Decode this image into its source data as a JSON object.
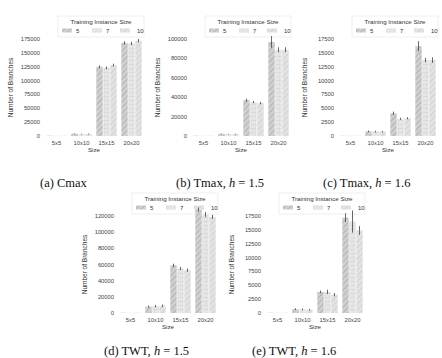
{
  "legend": {
    "title": "Training Instance Size",
    "entries": [
      "5",
      "7",
      "10"
    ]
  },
  "chart_data": [
    {
      "id": "a",
      "type": "bar",
      "caption": "(a) Cmax",
      "title": "",
      "xlabel": "Size",
      "ylabel": "Number of Branches",
      "categories": [
        "5x5",
        "10x10",
        "15x15",
        "20x20"
      ],
      "yticks": [
        0,
        25000,
        50000,
        75000,
        100000,
        125000,
        150000,
        175000
      ],
      "ylim": [
        0,
        180000
      ],
      "legend_title": "Training Instance Size",
      "legend_position": "top",
      "grid": false,
      "series": [
        {
          "name": "5",
          "values": [
            50,
            4000,
            125000,
            168000
          ],
          "errors": [
            0,
            800,
            2500,
            3000
          ]
        },
        {
          "name": "7",
          "values": [
            50,
            3500,
            123000,
            167000
          ],
          "errors": [
            0,
            700,
            2500,
            3000
          ]
        },
        {
          "name": "10",
          "values": [
            50,
            3800,
            128000,
            172000
          ],
          "errors": [
            0,
            700,
            2500,
            3000
          ]
        }
      ]
    },
    {
      "id": "b",
      "type": "bar",
      "caption": "(b) Tmax, h = 1.5",
      "title": "",
      "xlabel": "Size",
      "ylabel": "Number of Branches",
      "categories": [
        "5x5",
        "10x10",
        "15x15",
        "20x20"
      ],
      "yticks": [
        0,
        20000,
        40000,
        60000,
        80000,
        100000
      ],
      "ylim": [
        0,
        105000
      ],
      "legend_title": "Training Instance Size",
      "legend_position": "top",
      "grid": false,
      "series": [
        {
          "name": "5",
          "values": [
            30,
            2200,
            37000,
            97000
          ],
          "errors": [
            0,
            400,
            1500,
            6000
          ]
        },
        {
          "name": "7",
          "values": [
            30,
            1900,
            35000,
            89000
          ],
          "errors": [
            0,
            400,
            1200,
            2500
          ]
        },
        {
          "name": "10",
          "values": [
            30,
            2000,
            34000,
            89000
          ],
          "errors": [
            0,
            400,
            1200,
            2500
          ]
        }
      ]
    },
    {
      "id": "c",
      "type": "bar",
      "caption": "(c) Tmax, h = 1.6",
      "title": "",
      "xlabel": "Size",
      "ylabel": "Number of Branches",
      "categories": [
        "5x5",
        "10x10",
        "15x15",
        "20x20"
      ],
      "yticks": [
        0,
        2500,
        5000,
        7500,
        10000,
        12500,
        15000,
        17500
      ],
      "ylim": [
        0,
        18000
      ],
      "legend_title": "Training Instance Size",
      "legend_position": "top",
      "grid": false,
      "series": [
        {
          "name": "5",
          "values": [
            10,
            850,
            4100,
            16200
          ],
          "errors": [
            0,
            150,
            300,
            900
          ]
        },
        {
          "name": "7",
          "values": [
            10,
            800,
            3100,
            13700
          ],
          "errors": [
            0,
            150,
            200,
            400
          ]
        },
        {
          "name": "10",
          "values": [
            10,
            780,
            3200,
            13700
          ],
          "errors": [
            0,
            150,
            200,
            500
          ]
        }
      ]
    },
    {
      "id": "d",
      "type": "bar",
      "caption": "(d) TWT, h = 1.5",
      "title": "",
      "xlabel": "Size",
      "ylabel": "Number of Branches",
      "categories": [
        "5x5",
        "10x10",
        "15x15",
        "20x20"
      ],
      "yticks": [
        0,
        20000,
        40000,
        60000,
        80000,
        100000,
        120000
      ],
      "ylim": [
        0,
        130000
      ],
      "legend_title": "Training Instance Size",
      "legend_position": "top",
      "grid": false,
      "series": [
        {
          "name": "5",
          "values": [
            100,
            8000,
            59000,
            128000
          ],
          "errors": [
            0,
            1200,
            2000,
            2500
          ]
        },
        {
          "name": "7",
          "values": [
            100,
            8500,
            55000,
            122000
          ],
          "errors": [
            0,
            1500,
            2000,
            3000
          ]
        },
        {
          "name": "10",
          "values": [
            100,
            9000,
            53000,
            119000
          ],
          "errors": [
            0,
            1500,
            2000,
            2500
          ]
        }
      ]
    },
    {
      "id": "e",
      "type": "bar",
      "caption": "(e) TWT, h = 1.6",
      "title": "",
      "xlabel": "Size",
      "ylabel": "Number of Branches",
      "categories": [
        "5x5",
        "10x10",
        "15x15",
        "20x20"
      ],
      "yticks": [
        0,
        2500,
        5000,
        7500,
        10000,
        12500,
        15000,
        17500
      ],
      "ylim": [
        0,
        18500
      ],
      "legend_title": "Training Instance Size",
      "legend_position": "top",
      "grid": false,
      "series": [
        {
          "name": "5",
          "values": [
            15,
            700,
            3800,
            17200
          ],
          "errors": [
            0,
            150,
            250,
            800
          ]
        },
        {
          "name": "7",
          "values": [
            15,
            650,
            3800,
            16500
          ],
          "errors": [
            0,
            150,
            400,
            2000
          ]
        },
        {
          "name": "10",
          "values": [
            15,
            600,
            3300,
            14900
          ],
          "errors": [
            0,
            150,
            300,
            800
          ]
        }
      ]
    }
  ],
  "panels": [
    {
      "left": 0,
      "top": 8,
      "caption_left": 40,
      "caption_top": 176
    },
    {
      "left": 147,
      "top": 8,
      "caption_left": 176,
      "caption_top": 176
    },
    {
      "left": 294,
      "top": 8,
      "caption_left": 323,
      "caption_top": 176
    },
    {
      "left": 74,
      "top": 185,
      "caption_left": 104,
      "caption_top": 344
    },
    {
      "left": 221,
      "top": 185,
      "caption_left": 252,
      "caption_top": 344
    }
  ],
  "captions": [
    {
      "label": "(a)",
      "name": "Cmax",
      "h": ""
    },
    {
      "label": "(b)",
      "name": "Tmax,",
      "h": "1.5"
    },
    {
      "label": "(c)",
      "name": "Tmax,",
      "h": "1.6"
    },
    {
      "label": "(d)",
      "name": "TWT,",
      "h": "1.5"
    },
    {
      "label": "(e)",
      "name": "TWT,",
      "h": "1.6"
    }
  ]
}
